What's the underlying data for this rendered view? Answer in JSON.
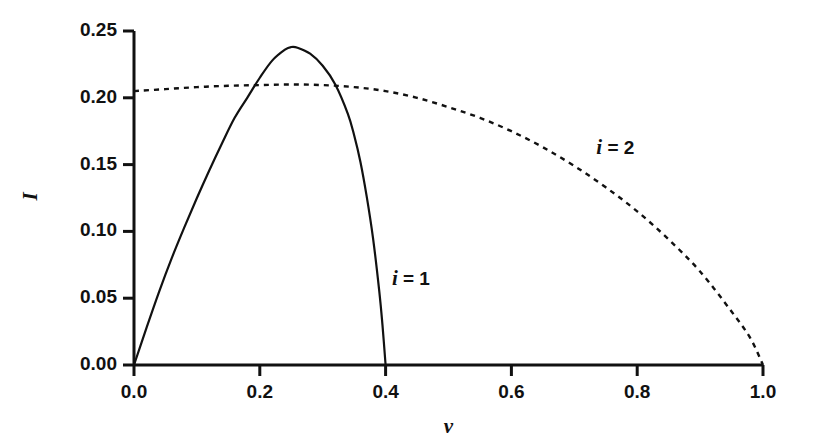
{
  "chart_data": {
    "type": "line",
    "title": "",
    "xlabel": "v",
    "ylabel": "I",
    "xlim": [
      0.0,
      1.0
    ],
    "ylim": [
      0.0,
      0.25
    ],
    "grid": false,
    "legend_position": "inline-annotations",
    "xticks": [
      "0.0",
      "0.2",
      "0.4",
      "0.6",
      "0.8",
      "1.0"
    ],
    "xtick_values": [
      0.0,
      0.2,
      0.4,
      0.6,
      0.8,
      1.0
    ],
    "yticks": [
      "0.00",
      "0.05",
      "0.10",
      "0.15",
      "0.20",
      "0.25"
    ],
    "ytick_values": [
      0.0,
      0.05,
      0.1,
      0.15,
      0.2,
      0.25
    ],
    "series": [
      {
        "name": "i = 1",
        "style": "solid",
        "color": "#111111",
        "annotation": "i = 1",
        "annotation_x": 0.41,
        "annotation_y": 0.065,
        "x": [
          0.0,
          0.02,
          0.04,
          0.06,
          0.08,
          0.1,
          0.12,
          0.14,
          0.16,
          0.18,
          0.2,
          0.22,
          0.24,
          0.25,
          0.26,
          0.28,
          0.3,
          0.32,
          0.34,
          0.35,
          0.36,
          0.37,
          0.38,
          0.39,
          0.395,
          0.4
        ],
        "y": [
          0.0,
          0.028,
          0.055,
          0.08,
          0.103,
          0.125,
          0.146,
          0.166,
          0.185,
          0.2,
          0.215,
          0.228,
          0.236,
          0.238,
          0.2375,
          0.233,
          0.224,
          0.21,
          0.188,
          0.172,
          0.152,
          0.126,
          0.095,
          0.055,
          0.03,
          0.0
        ]
      },
      {
        "name": "i = 2",
        "style": "dashed",
        "color": "#111111",
        "annotation": "i = 2",
        "annotation_x": 0.735,
        "annotation_y": 0.163,
        "x": [
          0.0,
          0.05,
          0.1,
          0.15,
          0.2,
          0.25,
          0.3,
          0.35,
          0.4,
          0.45,
          0.5,
          0.55,
          0.6,
          0.65,
          0.7,
          0.75,
          0.8,
          0.85,
          0.9,
          0.95,
          0.98,
          1.0
        ],
        "y": [
          0.205,
          0.2065,
          0.208,
          0.209,
          0.2095,
          0.21,
          0.2095,
          0.208,
          0.205,
          0.2,
          0.193,
          0.185,
          0.175,
          0.163,
          0.149,
          0.133,
          0.115,
          0.094,
          0.07,
          0.04,
          0.02,
          0.0
        ]
      }
    ]
  },
  "axes": {
    "y_title": "I",
    "x_title": "v"
  }
}
